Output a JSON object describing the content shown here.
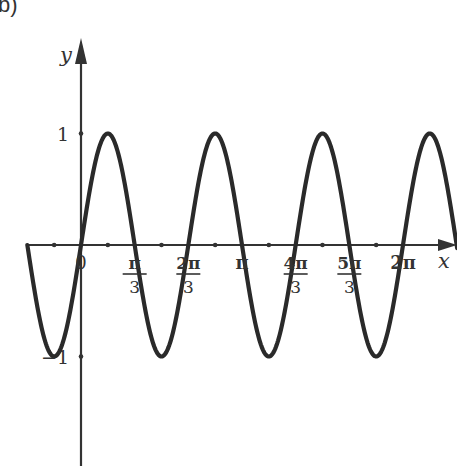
{
  "panel_label": "b)",
  "chart_data": {
    "type": "line",
    "title": "",
    "function": "y = sin(3x)",
    "xlabel": "x",
    "ylabel": "y",
    "xlim": [
      -1.047,
      7.34
    ],
    "ylim": [
      -2.0,
      2.0
    ],
    "grid": false,
    "legend": null,
    "x_ticks": [
      {
        "value": 0,
        "label": "0",
        "num": "0",
        "den": ""
      },
      {
        "value": 1.0472,
        "label": "π/3",
        "num": "π",
        "den": "3"
      },
      {
        "value": 2.0944,
        "label": "2π/3",
        "num": "2π",
        "den": "3"
      },
      {
        "value": 3.1416,
        "label": "π",
        "num": "π",
        "den": ""
      },
      {
        "value": 4.1888,
        "label": "4π/3",
        "num": "4π",
        "den": "3"
      },
      {
        "value": 5.236,
        "label": "5π/3",
        "num": "5π",
        "den": "3"
      },
      {
        "value": 6.2832,
        "label": "2π",
        "num": "2π",
        "den": ""
      }
    ],
    "x_minor_ticks": [
      -0.5236,
      0.5236,
      1.5708,
      2.618,
      3.6652,
      4.7124,
      5.7596
    ],
    "y_ticks": [
      {
        "value": 1,
        "label": "1"
      },
      {
        "value": -1,
        "label": "−1"
      }
    ],
    "series": [
      {
        "name": "sin(3x)",
        "x_start": -1.0472,
        "x_end": 7.34,
        "peaks_x": [
          0.5236,
          2.618,
          4.7124,
          6.8068
        ],
        "troughs_x": [
          -0.5236,
          1.5708,
          3.6652,
          5.7596
        ],
        "zeros_x": [
          -1.0472,
          0,
          1.0472,
          2.0944,
          3.1416,
          4.1888,
          5.236,
          6.2832
        ]
      }
    ]
  },
  "colors": {
    "curve": "#2a2a2a",
    "axis": "#333333",
    "text": "#333333"
  }
}
